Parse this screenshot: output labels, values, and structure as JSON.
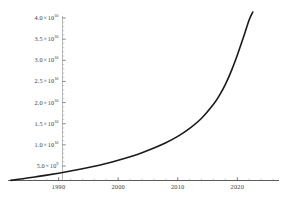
{
  "chart_data": {
    "type": "line",
    "title": "",
    "subtitle": "",
    "xlabel": "",
    "ylabel": "",
    "xlim": [
      1981.5,
      2027.0
    ],
    "ylim": [
      0,
      43000000000
    ],
    "grid": false,
    "legend": null,
    "axis_style": "mathematica-frameless",
    "line_color": "#1a1a1a",
    "line_width": 1.6,
    "x_ticks": [
      1990,
      2000,
      2010,
      2020
    ],
    "x_tick_labels": [
      "1990",
      "2000",
      "2010",
      "2020"
    ],
    "x_minor_tick_count": 5,
    "y_ticks": [
      5000000000,
      10000000000,
      15000000000,
      20000000000,
      25000000000,
      30000000000,
      35000000000,
      40000000000
    ],
    "y_tick_labels": [
      {
        "mantissa": "5.0",
        "times": "×",
        "base": "10",
        "exponent": "9"
      },
      {
        "mantissa": "1.0",
        "times": "×",
        "base": "10",
        "exponent": "10"
      },
      {
        "mantissa": "1.5",
        "times": "×",
        "base": "10",
        "exponent": "10"
      },
      {
        "mantissa": "2.0",
        "times": "×",
        "base": "10",
        "exponent": "10"
      },
      {
        "mantissa": "2.5",
        "times": "×",
        "base": "10",
        "exponent": "10"
      },
      {
        "mantissa": "3.0",
        "times": "×",
        "base": "10",
        "exponent": "10"
      },
      {
        "mantissa": "3.5",
        "times": "×",
        "base": "10",
        "exponent": "10"
      },
      {
        "mantissa": "4.0",
        "times": "×",
        "base": "10",
        "exponent": "10"
      }
    ],
    "series": [
      {
        "name": "exponential-growth",
        "x": [
          1982,
          1984,
          1986,
          1988,
          1990,
          1992,
          1994,
          1996,
          1998,
          2000,
          2002,
          2004,
          2006,
          2008,
          2010,
          2012,
          2014,
          2016,
          2017,
          2018,
          2019,
          2020,
          2021,
          2022,
          2022.6
        ],
        "y": [
          1600000000,
          2000000000,
          2400000000,
          2850000000,
          3300000000,
          3800000000,
          4350000000,
          4950000000,
          5600000000,
          6350000000,
          7200000000,
          8150000000,
          9250000000,
          10500000000,
          12000000000,
          13900000000,
          16300000000,
          19600000000,
          21700000000,
          24300000000,
          27500000000,
          31200000000,
          35300000000,
          39600000000,
          41400000000
        ]
      }
    ]
  },
  "axes": {
    "y_axis_name": "y-axis",
    "x_axis_name": "x-axis"
  }
}
